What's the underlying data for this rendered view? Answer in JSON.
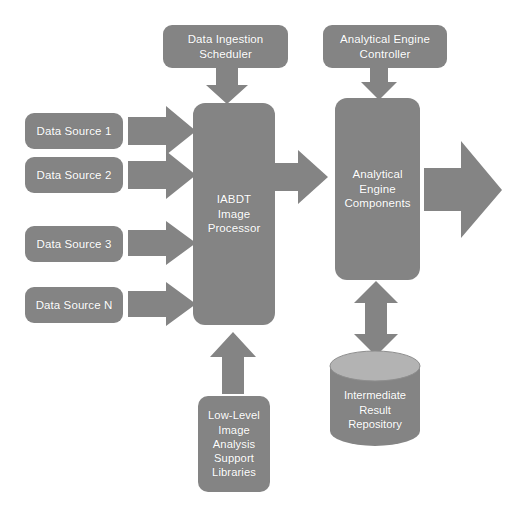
{
  "diagram": {
    "background_color": "#ffffff",
    "shape_fill_color": "#848484",
    "cylinder_top_color": "#b3b3b3",
    "text_color": "#ffffff",
    "arrow_color": "#848484"
  },
  "nodes": {
    "data_ingestion_scheduler": {
      "line1": "Data Ingestion",
      "line2": "Scheduler"
    },
    "analytical_engine_controller": {
      "line1": "Analytical Engine",
      "line2": "Controller"
    },
    "data_sources": [
      {
        "label": "Data Source 1"
      },
      {
        "label": "Data Source 2"
      },
      {
        "label": "Data Source 3"
      },
      {
        "label": "Data Source N"
      }
    ],
    "iabdt_image_processor": {
      "line1": "IABDT",
      "line2": "Image",
      "line3": "Processor"
    },
    "analytical_engine_components": {
      "line1": "Analytical",
      "line2": "Engine",
      "line3": "Components"
    },
    "low_level_libraries": {
      "line1": "Low-Level",
      "line2": "Image",
      "line3": "Analysis",
      "line4": "Support",
      "line5": "Libraries"
    },
    "intermediate_result_repository": {
      "line1": "Intermediate",
      "line2": "Result",
      "line3": "Repository"
    }
  },
  "connectors": [
    {
      "name": "scheduler-to-processor",
      "from": "data_ingestion_scheduler",
      "to": "iabdt_image_processor",
      "direction": "down",
      "style": "block-arrow"
    },
    {
      "name": "controller-to-engine",
      "from": "analytical_engine_controller",
      "to": "analytical_engine_components",
      "direction": "down",
      "style": "block-arrow"
    },
    {
      "name": "source1-to-processor",
      "from": "data_sources.0",
      "to": "iabdt_image_processor",
      "direction": "right",
      "style": "block-arrow"
    },
    {
      "name": "source2-to-processor",
      "from": "data_sources.1",
      "to": "iabdt_image_processor",
      "direction": "right",
      "style": "block-arrow"
    },
    {
      "name": "source3-to-processor",
      "from": "data_sources.2",
      "to": "iabdt_image_processor",
      "direction": "right",
      "style": "block-arrow"
    },
    {
      "name": "sourceN-to-processor",
      "from": "data_sources.3",
      "to": "iabdt_image_processor",
      "direction": "right",
      "style": "block-arrow"
    },
    {
      "name": "processor-to-engine",
      "from": "iabdt_image_processor",
      "to": "analytical_engine_components",
      "direction": "right",
      "style": "block-arrow"
    },
    {
      "name": "engine-to-output",
      "from": "analytical_engine_components",
      "to": "output",
      "direction": "right",
      "style": "block-arrow"
    },
    {
      "name": "libraries-to-processor",
      "from": "low_level_libraries",
      "to": "iabdt_image_processor",
      "direction": "up",
      "style": "block-arrow"
    },
    {
      "name": "engine-repository-bidirectional",
      "from": "analytical_engine_components",
      "to": "intermediate_result_repository",
      "direction": "bidirectional-vertical",
      "style": "block-arrow"
    }
  ]
}
